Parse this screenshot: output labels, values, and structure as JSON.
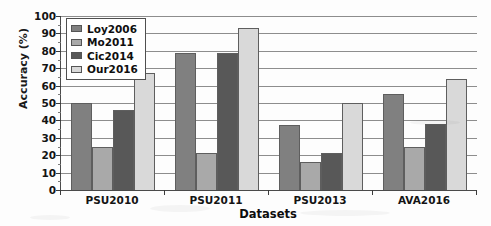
{
  "chart_data": {
    "type": "bar",
    "title": "",
    "xlabel": "Datasets",
    "ylabel": "Accuracy (%)",
    "categories": [
      "PSU2010",
      "PSU2011",
      "PSU2013",
      "AVA2016"
    ],
    "series": [
      {
        "name": "Loy2006",
        "color": "#808080",
        "values": [
          50,
          79,
          37.5,
          55
        ]
      },
      {
        "name": "Mo2011",
        "color": "#a9a9a9",
        "values": [
          25,
          21,
          16,
          25
        ]
      },
      {
        "name": "Cic2014",
        "color": "#585858",
        "values": [
          46,
          79,
          21,
          38
        ]
      },
      {
        "name": "Our2016",
        "color": "#d9d9d9",
        "values": [
          67,
          93,
          50,
          64
        ]
      }
    ],
    "ylim": [
      0,
      100
    ],
    "yticks": [
      0,
      10,
      20,
      30,
      40,
      50,
      60,
      70,
      80,
      90,
      100
    ],
    "ytick_labels": [
      "0",
      "10",
      "20",
      "30",
      "40",
      "50",
      "60",
      "70",
      "80",
      "90",
      "100"
    ],
    "grid": true,
    "legend_position": "upper-left"
  }
}
